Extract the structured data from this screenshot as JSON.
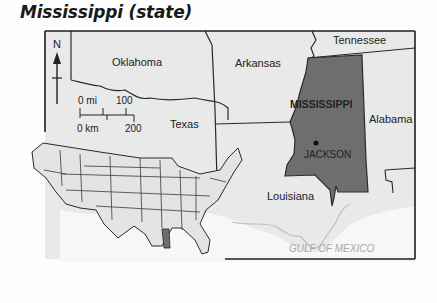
{
  "title": "Mississippi (state)",
  "map": {
    "compass": {
      "label": "N",
      "icon": "north-arrow-icon"
    },
    "scale_bar": {
      "miles_start": "0 mi",
      "miles_end": "100",
      "km_start": "0 km",
      "km_end": "200"
    },
    "labels": {
      "oklahoma": "Oklahoma",
      "arkansas": "Arkansas",
      "tennessee": "Tennessee",
      "mississippi": "MISSISSIPPI",
      "alabama": "Alabama",
      "texas": "Texas",
      "louisiana": "Louisiana",
      "jackson": "JACKSON",
      "gulf": "GULF OF MEXICO"
    },
    "colors": {
      "land": "#e9e9e9",
      "highlight": "#6e6e6e",
      "border": "#2a2a2a",
      "water": "#fafafa",
      "gulf_text": "#a8a8a8"
    },
    "inset": {
      "description": "US locator map with Mississippi highlighted"
    }
  }
}
